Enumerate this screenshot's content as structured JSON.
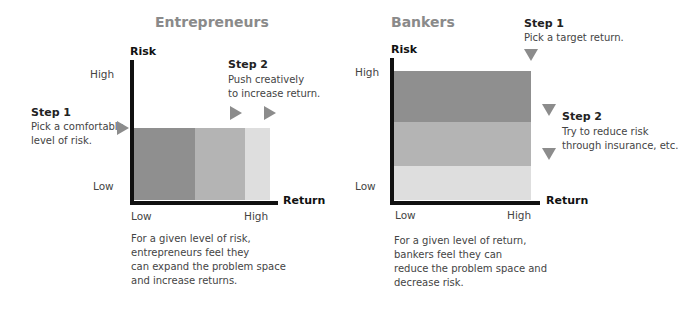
{
  "colors": {
    "dark_band": "#8f8f8f",
    "medium_band": "#b4b4b4",
    "light_band": "#dedede",
    "axis": "#111111",
    "marker": "#8c8c8c",
    "panel_title": "#8a8a8a"
  },
  "entrepreneurs": {
    "title": "Entrepreneurs",
    "y_axis_label": "Risk",
    "x_axis_label": "Return",
    "y_high": "High",
    "y_low": "Low",
    "x_low": "Low",
    "x_high": "High",
    "step1": {
      "heading": "Step 1",
      "text": "Pick a comfortable\nlevel of risk."
    },
    "step2": {
      "heading": "Step 2",
      "text": "Push creatively\nto increase return."
    },
    "caption": "For a given level of risk,\nentrepreneurs feel they\ncan expand the problem space\nand increase returns.",
    "markers": [
      "right-triangle-step1",
      "right-triangle-step2a",
      "right-triangle-step2b"
    ]
  },
  "bankers": {
    "title": "Bankers",
    "y_axis_label": "Risk",
    "x_axis_label": "Return",
    "y_high": "High",
    "y_low": "Low",
    "x_low": "Low",
    "x_high": "High",
    "step1": {
      "heading": "Step 1",
      "text": "Pick a target return."
    },
    "step2": {
      "heading": "Step 2",
      "text": "Try to reduce risk\nthrough insurance, etc."
    },
    "caption": "For a given level of return,\nbankers feel they can\nreduce the problem space and\ndecrease risk.",
    "markers": [
      "down-triangle-step1",
      "down-triangle-step2a",
      "down-triangle-step2b"
    ]
  }
}
